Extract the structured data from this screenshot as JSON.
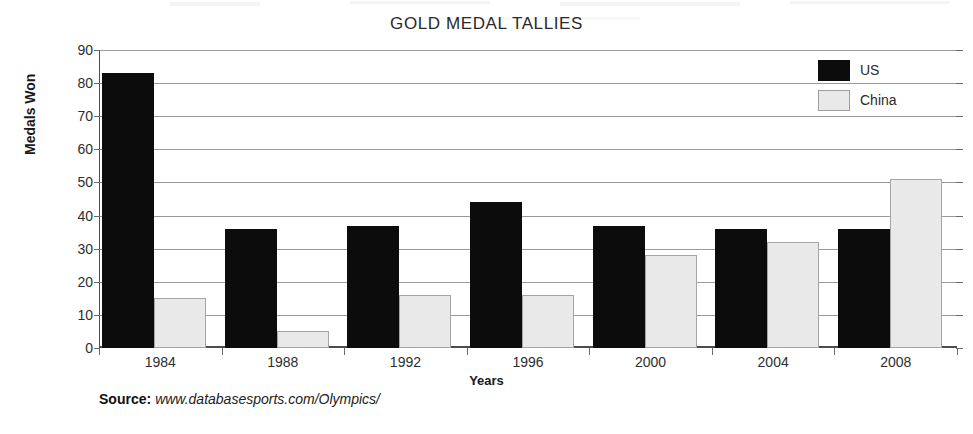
{
  "chart_data": {
    "type": "bar",
    "title": "GOLD MEDAL TALLIES",
    "xlabel": "Years",
    "ylabel": "Medals Won",
    "categories": [
      "1984",
      "1988",
      "1992",
      "1996",
      "2000",
      "2004",
      "2008"
    ],
    "series": [
      {
        "name": "US",
        "color": "#0c0c0c",
        "values": [
          83,
          36,
          37,
          44,
          37,
          36,
          36
        ]
      },
      {
        "name": "China",
        "color": "#e9e9e9",
        "values": [
          15,
          5,
          16,
          16,
          28,
          32,
          51
        ]
      }
    ],
    "ylim": [
      0,
      90
    ],
    "ytick_labels": [
      "90",
      "80",
      "70",
      "60",
      "50",
      "40",
      "30",
      "20",
      "10",
      "0"
    ],
    "ytick_values": [
      90,
      80,
      70,
      60,
      50,
      40,
      30,
      20,
      10,
      0
    ],
    "ytick_step": 10,
    "grid": "horizontal",
    "legend_position": "top-right",
    "legend_entries": [
      "US",
      "China"
    ]
  },
  "source": {
    "label": "Source:",
    "url": "www.databasesports.com/Olympics/"
  }
}
